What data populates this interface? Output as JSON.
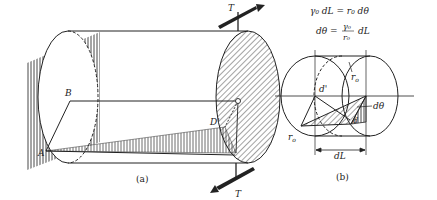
{
  "figure_a": {
    "caption": "(a)",
    "labels": {
      "B": "B",
      "A": "A",
      "D_prime": "D'",
      "C": "C",
      "D": "D",
      "T_top": "T",
      "T_bottom": "T"
    }
  },
  "figure_b": {
    "caption": "(b)",
    "labels": {
      "r0_top": "r",
      "r0_top_sub": "o",
      "r0_bottom": "r",
      "r0_bottom_sub": "o",
      "d_prime": "d'",
      "d": "d",
      "dtheta": "dθ",
      "dL": "dL"
    }
  },
  "equations": {
    "line1": "γ₀ dL = r₀ dθ",
    "line2_lhs": "dθ =",
    "line2_num": "γ₀",
    "line2_den": "r₀",
    "line2_rhs": "dL"
  },
  "colors": {
    "ink": "#222222",
    "hatch": "#333333",
    "background": "#ffffff"
  }
}
